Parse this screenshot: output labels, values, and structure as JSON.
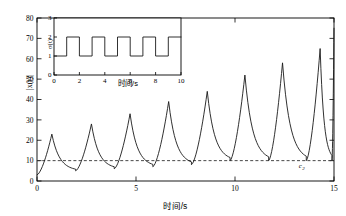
{
  "chart_data": {
    "type": "line",
    "title": "",
    "xlabel": "时间/s",
    "ylabel": "|x(t)|",
    "xlim": [
      0,
      15
    ],
    "ylim": [
      0,
      80
    ],
    "xticks": [
      0,
      5,
      10,
      15
    ],
    "yticks": [
      0,
      10,
      20,
      30,
      40,
      50,
      60,
      70,
      80
    ],
    "grid": false,
    "legend": null,
    "series": [
      {
        "name": "|x(t)|",
        "color": "#1a1a1a",
        "linestyle": "solid",
        "peaks": [
          {
            "t": 0.75,
            "value": 23
          },
          {
            "t": 2.75,
            "value": 28
          },
          {
            "t": 4.7,
            "value": 33
          },
          {
            "t": 6.65,
            "value": 39
          },
          {
            "t": 8.6,
            "value": 44
          },
          {
            "t": 10.5,
            "value": 52
          },
          {
            "t": 12.4,
            "value": 58
          },
          {
            "t": 14.3,
            "value": 65
          },
          {
            "t": 15.0,
            "value": 75
          }
        ],
        "troughs": [
          {
            "t": 0.0,
            "value": 3
          },
          {
            "t": 1.95,
            "value": 5
          },
          {
            "t": 3.9,
            "value": 6
          },
          {
            "t": 5.85,
            "value": 7
          },
          {
            "t": 7.8,
            "value": 8
          },
          {
            "t": 9.75,
            "value": 10
          },
          {
            "t": 11.7,
            "value": 10
          },
          {
            "t": 13.6,
            "value": 10
          },
          {
            "t": 14.9,
            "value": 10
          }
        ]
      },
      {
        "name": "c2",
        "color": "#333333",
        "linestyle": "dashed",
        "constant_value": 10,
        "annotation": "c₂"
      }
    ],
    "annotations": [
      {
        "text": "c",
        "subscript": "2",
        "x": 13.3,
        "y": 6.5
      }
    ],
    "inset": {
      "type": "line",
      "xlabel": "时间/s",
      "ylabel": "σ(t)",
      "xlim": [
        0,
        10
      ],
      "ylim": [
        0,
        3
      ],
      "xticks": [
        0,
        2,
        4,
        6,
        8,
        10
      ],
      "yticks": [
        0,
        1,
        2,
        3
      ],
      "grid": false,
      "series": [
        {
          "name": "σ(t)",
          "color": "#444444",
          "linestyle": "solid",
          "description": "square wave alternating between 1 and 2, period 2 s",
          "levels": [
            1,
            2
          ],
          "period": 2,
          "steps": [
            {
              "t_start": 0,
              "t_end": 1,
              "value": 1
            },
            {
              "t_start": 1,
              "t_end": 2,
              "value": 2
            },
            {
              "t_start": 2,
              "t_end": 3,
              "value": 1
            },
            {
              "t_start": 3,
              "t_end": 4,
              "value": 2
            },
            {
              "t_start": 4,
              "t_end": 5,
              "value": 1
            },
            {
              "t_start": 5,
              "t_end": 6,
              "value": 2
            },
            {
              "t_start": 6,
              "t_end": 7,
              "value": 1
            },
            {
              "t_start": 7,
              "t_end": 8,
              "value": 2
            },
            {
              "t_start": 8,
              "t_end": 9,
              "value": 1
            },
            {
              "t_start": 9,
              "t_end": 10,
              "value": 2
            }
          ]
        }
      ]
    }
  },
  "axes": {
    "main": {
      "ylabel": "|x(t)|",
      "xlabel": "时间/s",
      "xtick_labels": [
        "0",
        "5",
        "10",
        "15"
      ],
      "ytick_labels": [
        "0",
        "10",
        "20",
        "30",
        "40",
        "50",
        "60",
        "70",
        "80"
      ]
    },
    "inset": {
      "ylabel": "σ(t)",
      "xlabel": "时间/s",
      "xtick_labels": [
        "0",
        "2",
        "4",
        "6",
        "8",
        "10"
      ],
      "ytick_labels": [
        "0",
        "1",
        "2",
        "3"
      ]
    }
  },
  "labels": {
    "c2_base": "c",
    "c2_sub": "2"
  }
}
